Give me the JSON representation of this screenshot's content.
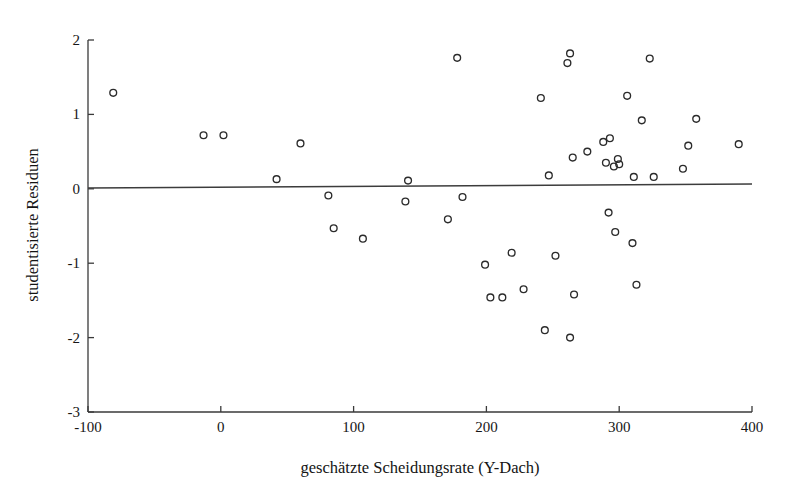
{
  "chart_data": {
    "type": "scatter",
    "title": "",
    "subtitle": "",
    "xlabel": "geschätzte Scheidungsrate (Y-Dach)",
    "ylabel": "studentisierte Residuen",
    "xlim": [
      -100,
      400
    ],
    "ylim": [
      -3,
      2
    ],
    "xticks": [
      -100,
      0,
      100,
      200,
      300,
      400
    ],
    "xtick_labels": [
      "-100",
      "0",
      "100",
      "200",
      "300",
      "400"
    ],
    "yticks": [
      -3,
      -2,
      -1,
      0,
      1,
      2
    ],
    "ytick_labels": [
      "-3",
      "-2",
      "-1",
      "0",
      "1",
      "2"
    ],
    "grid": false,
    "legend": null,
    "reference_lines": [
      {
        "name": "zero-residual-line",
        "orientation": "horizontal",
        "y": 0
      }
    ],
    "marker": {
      "shape": "open-circle",
      "radius_px": 4,
      "stroke": "#2b2b2b",
      "fill": "none"
    },
    "series": [
      {
        "name": "studentisierte Residuen",
        "points": [
          {
            "x": -81,
            "y": 1.29
          },
          {
            "x": -13,
            "y": 0.72
          },
          {
            "x": 2,
            "y": 0.72
          },
          {
            "x": 42,
            "y": 0.13
          },
          {
            "x": 60,
            "y": 0.61
          },
          {
            "x": 81,
            "y": -0.09
          },
          {
            "x": 85,
            "y": -0.53
          },
          {
            "x": 107,
            "y": -0.67
          },
          {
            "x": 139,
            "y": -0.17
          },
          {
            "x": 141,
            "y": 0.11
          },
          {
            "x": 171,
            "y": -0.41
          },
          {
            "x": 178,
            "y": 1.76
          },
          {
            "x": 182,
            "y": -0.11
          },
          {
            "x": 199,
            "y": -1.02
          },
          {
            "x": 203,
            "y": -1.46
          },
          {
            "x": 212,
            "y": -1.46
          },
          {
            "x": 219,
            "y": -0.86
          },
          {
            "x": 228,
            "y": -1.35
          },
          {
            "x": 241,
            "y": 1.22
          },
          {
            "x": 244,
            "y": -1.9
          },
          {
            "x": 247,
            "y": 0.18
          },
          {
            "x": 252,
            "y": -0.9
          },
          {
            "x": 261,
            "y": 1.69
          },
          {
            "x": 263,
            "y": 1.82
          },
          {
            "x": 263,
            "y": -2.0
          },
          {
            "x": 265,
            "y": 0.42
          },
          {
            "x": 266,
            "y": -1.42
          },
          {
            "x": 276,
            "y": 0.5
          },
          {
            "x": 288,
            "y": 0.63
          },
          {
            "x": 290,
            "y": 0.35
          },
          {
            "x": 292,
            "y": -0.32
          },
          {
            "x": 293,
            "y": 0.68
          },
          {
            "x": 296,
            "y": 0.3
          },
          {
            "x": 297,
            "y": -0.58
          },
          {
            "x": 299,
            "y": 0.4
          },
          {
            "x": 300,
            "y": 0.33
          },
          {
            "x": 306,
            "y": 1.25
          },
          {
            "x": 310,
            "y": -0.73
          },
          {
            "x": 311,
            "y": 0.16
          },
          {
            "x": 313,
            "y": -1.29
          },
          {
            "x": 317,
            "y": 0.92
          },
          {
            "x": 323,
            "y": 1.75
          },
          {
            "x": 326,
            "y": 0.16
          },
          {
            "x": 348,
            "y": 0.27
          },
          {
            "x": 352,
            "y": 0.58
          },
          {
            "x": 358,
            "y": 0.94
          },
          {
            "x": 390,
            "y": 0.6
          }
        ]
      }
    ]
  },
  "axes": {
    "x_axis_name": "x-axis",
    "y_axis_name": "y-axis"
  }
}
